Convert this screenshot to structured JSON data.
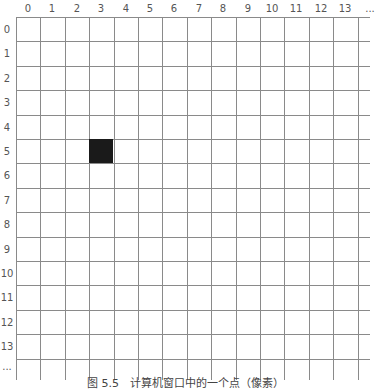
{
  "figure": {
    "caption": "图 5.5　计算机窗口中的一个点（像素）",
    "column_labels": [
      "0",
      "1",
      "2",
      "3",
      "4",
      "5",
      "6",
      "7",
      "8",
      "9",
      "10",
      "11",
      "12",
      "13",
      "..."
    ],
    "row_labels": [
      "0",
      "1",
      "2",
      "3",
      "4",
      "5",
      "6",
      "7",
      "8",
      "9",
      "10",
      "11",
      "12",
      "13",
      "..."
    ],
    "grid": {
      "origin_x": 16,
      "origin_y": 17,
      "cell_size": 24.4,
      "columns": 14,
      "rows": 14,
      "line_color": "#8a8a8a"
    },
    "highlighted_pixel": {
      "column": 3,
      "row": 5,
      "color": "#1a1a1a"
    }
  }
}
